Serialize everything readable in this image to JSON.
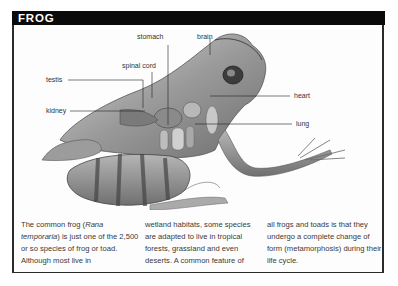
{
  "panel": {
    "title": "FROG"
  },
  "diagram": {
    "labels": {
      "stomach": "stomach",
      "brain": "brain",
      "spinal_cord": "spinal cord",
      "testis": "testis",
      "kidney": "kidney",
      "heart": "heart",
      "lung": "lung"
    }
  },
  "caption": {
    "col1_a": "The common frog (",
    "col1_species": "Rana temporaria",
    "col1_b": ") is just one of the 2,500 or so species of frog or toad. Although most live in",
    "col2": "wetland habitats, some species are adapted to live in tropical forests, grassland and even deserts. A common feature of",
    "col3": "all frogs and toads is that they undergo a complete change of form (metamorphosis) during their life cycle."
  },
  "colors": {
    "title_bg": "#0a0a0a",
    "title_fg": "#ffffff",
    "border": "#2a2a2a",
    "text": "#3a3a3a"
  }
}
